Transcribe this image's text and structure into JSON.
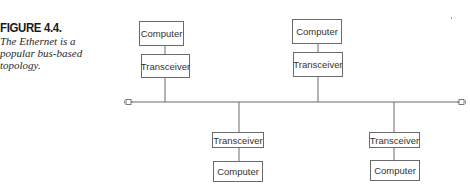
{
  "figure": {
    "heading": "FIGURE 4.4.",
    "caption": "The Ethernet is a popular bus-based topology."
  },
  "diagram": {
    "type": "bus-topology",
    "bus": {
      "y": 102,
      "x_start": 132,
      "x_end": 458
    },
    "terminators": [
      {
        "name": "left-terminator",
        "x": 125,
        "y": 102
      },
      {
        "name": "right-terminator",
        "x": 458,
        "y": 102
      }
    ],
    "nodes": {
      "top_left": {
        "computer": "Computer",
        "transceiver": "Transceiver"
      },
      "top_right": {
        "computer": "Computer",
        "transceiver": "Transceiver"
      },
      "bottom_left": {
        "transceiver": "Transceiver",
        "computer": "Computer"
      },
      "bottom_right": {
        "transceiver": "Transceiver",
        "computer": "Computer"
      }
    },
    "line_color": "#6a6a6a"
  }
}
